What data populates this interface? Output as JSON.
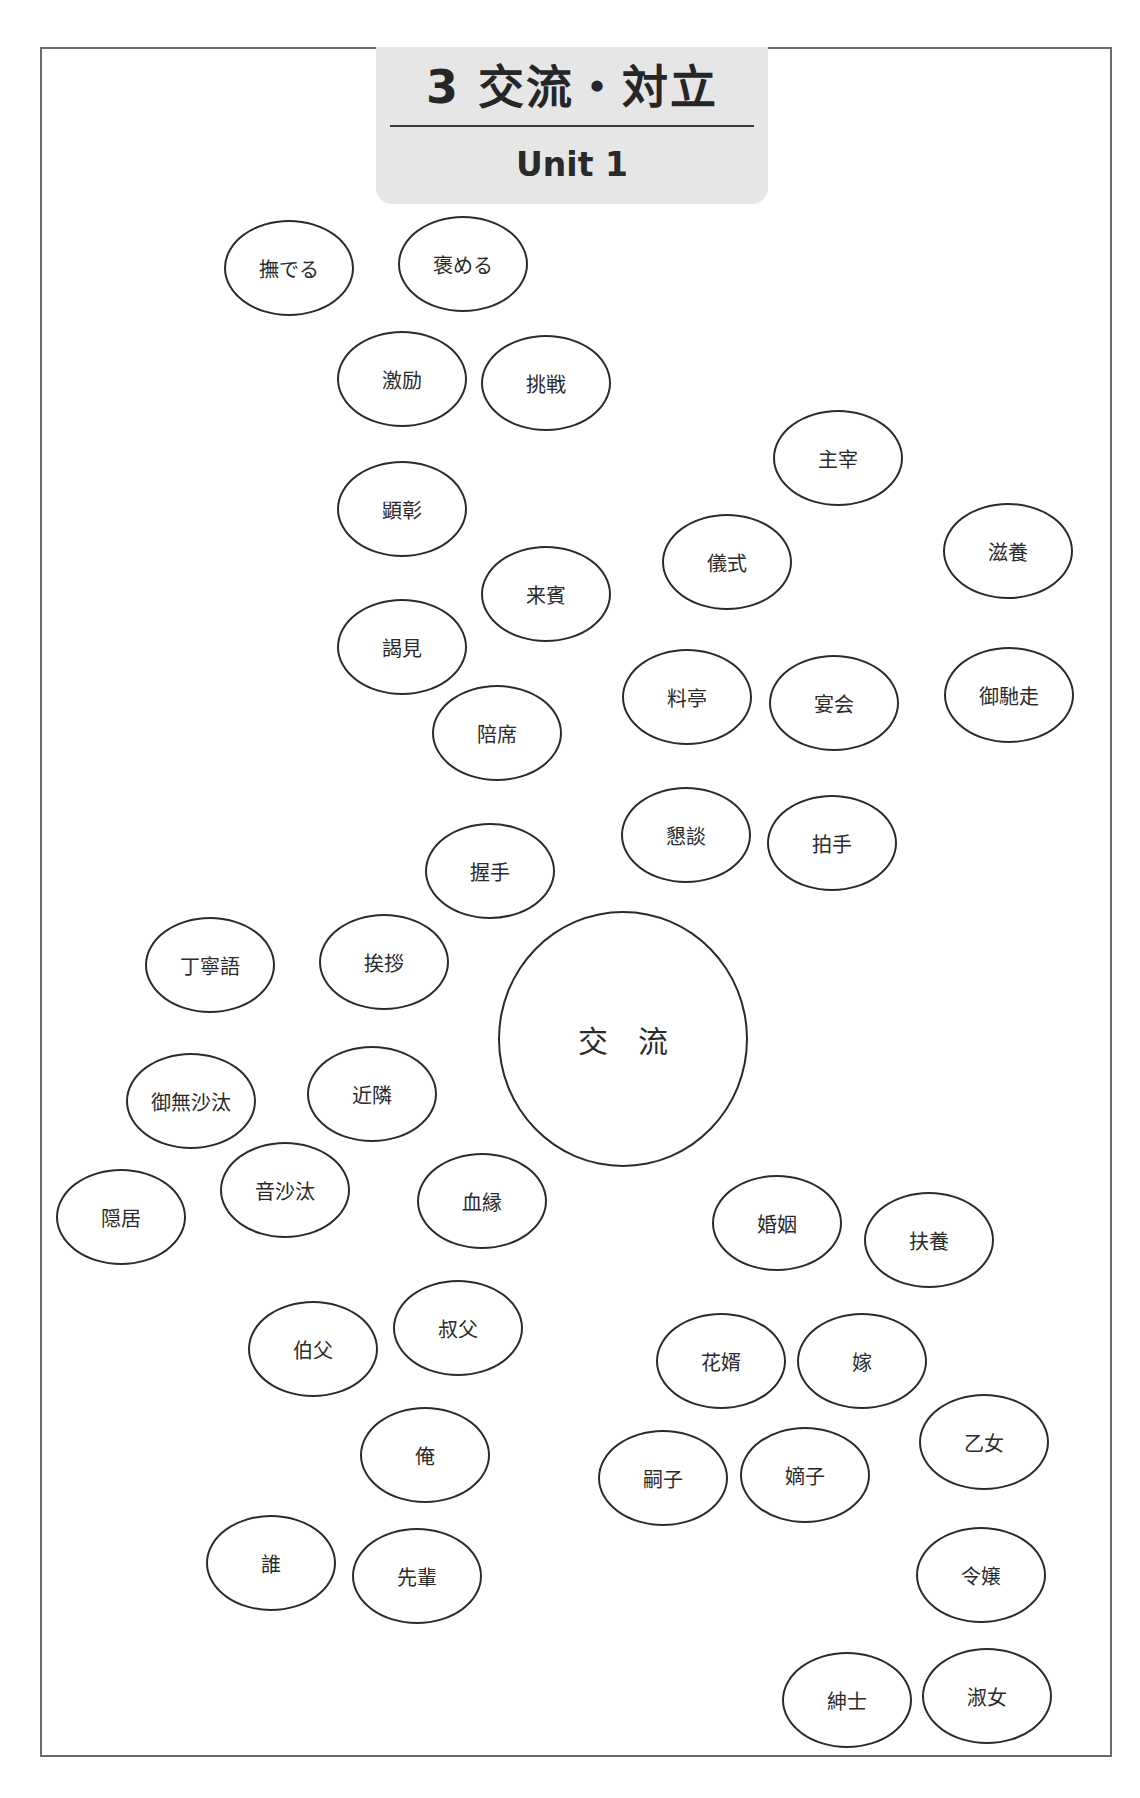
{
  "header": {
    "title": "3 交流・対立",
    "subtitle": "Unit 1"
  },
  "center": {
    "label": "交 流"
  },
  "bubbles": [
    {
      "label": "撫でる",
      "x": 289,
      "y": 268
    },
    {
      "label": "褒める",
      "x": 463,
      "y": 264
    },
    {
      "label": "激励",
      "x": 402,
      "y": 379
    },
    {
      "label": "挑戦",
      "x": 546,
      "y": 383
    },
    {
      "label": "主宰",
      "x": 838,
      "y": 458
    },
    {
      "label": "顕彰",
      "x": 402,
      "y": 509
    },
    {
      "label": "儀式",
      "x": 727,
      "y": 562
    },
    {
      "label": "滋養",
      "x": 1008,
      "y": 551
    },
    {
      "label": "来賓",
      "x": 546,
      "y": 594
    },
    {
      "label": "謁見",
      "x": 402,
      "y": 647
    },
    {
      "label": "料亭",
      "x": 687,
      "y": 697
    },
    {
      "label": "宴会",
      "x": 834,
      "y": 703
    },
    {
      "label": "御馳走",
      "x": 1009,
      "y": 695
    },
    {
      "label": "陪席",
      "x": 497,
      "y": 733
    },
    {
      "label": "懇談",
      "x": 686,
      "y": 835
    },
    {
      "label": "拍手",
      "x": 832,
      "y": 843
    },
    {
      "label": "握手",
      "x": 490,
      "y": 871
    },
    {
      "label": "丁寧語",
      "x": 210,
      "y": 965
    },
    {
      "label": "挨拶",
      "x": 384,
      "y": 962
    },
    {
      "label": "御無沙汰",
      "x": 191,
      "y": 1101
    },
    {
      "label": "近隣",
      "x": 372,
      "y": 1094
    },
    {
      "label": "音沙汰",
      "x": 285,
      "y": 1190
    },
    {
      "label": "隠居",
      "x": 121,
      "y": 1217
    },
    {
      "label": "血縁",
      "x": 482,
      "y": 1201
    },
    {
      "label": "婚姻",
      "x": 777,
      "y": 1223
    },
    {
      "label": "扶養",
      "x": 929,
      "y": 1240
    },
    {
      "label": "伯父",
      "x": 313,
      "y": 1349
    },
    {
      "label": "叔父",
      "x": 458,
      "y": 1328
    },
    {
      "label": "花婿",
      "x": 721,
      "y": 1361
    },
    {
      "label": "嫁",
      "x": 862,
      "y": 1361
    },
    {
      "label": "乙女",
      "x": 984,
      "y": 1442
    },
    {
      "label": "俺",
      "x": 425,
      "y": 1455
    },
    {
      "label": "嗣子",
      "x": 663,
      "y": 1478
    },
    {
      "label": "嫡子",
      "x": 805,
      "y": 1475
    },
    {
      "label": "誰",
      "x": 271,
      "y": 1563
    },
    {
      "label": "先輩",
      "x": 417,
      "y": 1576
    },
    {
      "label": "令嬢",
      "x": 981,
      "y": 1575
    },
    {
      "label": "紳士",
      "x": 847,
      "y": 1700
    },
    {
      "label": "淑女",
      "x": 987,
      "y": 1696
    }
  ]
}
